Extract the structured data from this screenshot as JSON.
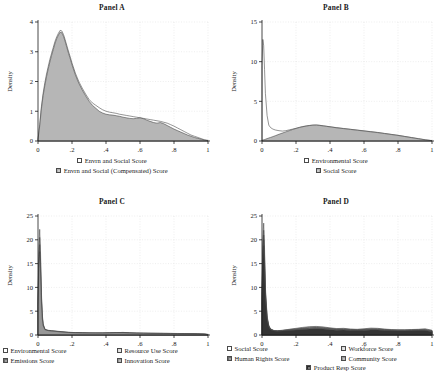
{
  "figure": {
    "background": "#ffffff",
    "axis_color": "#1a1a1a",
    "grid_color": "#d8d8d8"
  },
  "palette": {
    "white": "#ffffff",
    "light_gray": "#d9d9d9",
    "mid_gray": "#b0b0b0",
    "gray": "#9a9a9a",
    "dark_gray": "#6e6e6e",
    "darker_gray": "#4f4f4f",
    "near_black": "#2b2b2b",
    "outline": "#3c3c3c"
  },
  "panels": [
    {
      "id": "panel-a",
      "title": "Panel A",
      "ylabel": "Density",
      "xlim": [
        0,
        1
      ],
      "ylim": [
        0,
        4
      ],
      "yticks": [
        0,
        1,
        2,
        3,
        4
      ],
      "ytick_labels": [
        "0",
        "1",
        "2",
        "3",
        "4"
      ],
      "xticks": [
        0,
        0.2,
        0.4,
        0.6,
        0.8,
        1
      ],
      "xtick_labels": [
        "0",
        ".2",
        ".4",
        ".6",
        ".8",
        "1"
      ],
      "legend_rows": [
        [
          {
            "label": "Envrn and Social Score",
            "color": "#ffffff"
          }
        ],
        [
          {
            "label": "Envrn and Social (Compensated) Score",
            "color": "#b0b0b0"
          }
        ]
      ]
    },
    {
      "id": "panel-b",
      "title": "Panel B",
      "ylabel": "Density",
      "xlim": [
        0,
        1
      ],
      "ylim": [
        0,
        15
      ],
      "yticks": [
        0,
        5,
        10,
        15
      ],
      "ytick_labels": [
        "0",
        "5",
        "10",
        "15"
      ],
      "xticks": [
        0,
        0.2,
        0.4,
        0.6,
        0.8,
        1
      ],
      "xtick_labels": [
        "0",
        ".2",
        ".4",
        ".6",
        ".8",
        "1"
      ],
      "legend_rows": [
        [
          {
            "label": "Environmental Score",
            "color": "#ffffff"
          }
        ],
        [
          {
            "label": "Social Score",
            "color": "#b0b0b0"
          }
        ]
      ]
    },
    {
      "id": "panel-c",
      "title": "Panel C",
      "ylabel": "Density",
      "xlim": [
        0,
        1
      ],
      "ylim": [
        0,
        25
      ],
      "yticks": [
        0,
        5,
        10,
        15,
        20,
        25
      ],
      "ytick_labels": [
        "0",
        "5",
        "10",
        "15",
        "20",
        "25"
      ],
      "xticks": [
        0,
        0.2,
        0.4,
        0.6,
        0.8,
        1
      ],
      "xtick_labels": [
        "0",
        ".2",
        ".4",
        ".6",
        ".8",
        "1"
      ],
      "legend_rows": [
        [
          {
            "label": "Environmental Score",
            "color": "#ffffff"
          },
          {
            "label": "Resource Use Score",
            "color": "#d9d9d9"
          }
        ],
        [
          {
            "label": "Emissions Score",
            "color": "#6e6e6e"
          },
          {
            "label": "Innovation Score",
            "color": "#9a9a9a"
          }
        ]
      ]
    },
    {
      "id": "panel-d",
      "title": "Panel D",
      "ylabel": "Density",
      "xlim": [
        0,
        1
      ],
      "ylim": [
        0,
        25
      ],
      "yticks": [
        0,
        5,
        10,
        15,
        20,
        25
      ],
      "ytick_labels": [
        "0",
        "5",
        "10",
        "15",
        "20",
        "25"
      ],
      "xticks": [
        0,
        0.2,
        0.4,
        0.6,
        0.8,
        1
      ],
      "xtick_labels": [
        "0",
        ".2",
        ".4",
        ".6",
        ".8",
        "1"
      ],
      "legend_rows": [
        [
          {
            "label": "Social Score",
            "color": "#ffffff"
          },
          {
            "label": "Workforce Score",
            "color": "#d9d9d9"
          }
        ],
        [
          {
            "label": "Human Rights Score",
            "color": "#6e6e6e"
          },
          {
            "label": "Community Score",
            "color": "#9a9a9a"
          }
        ],
        [
          {
            "label": "Product Resp Score",
            "color": "#2b2b2b"
          }
        ]
      ]
    }
  ],
  "chart_data": [
    {
      "type": "area",
      "panel": "panel-a",
      "title": "Panel A",
      "xlabel": "",
      "ylabel": "Density",
      "xlim": [
        0,
        1
      ],
      "ylim": [
        0,
        4
      ],
      "grid": true,
      "legend_position": "below",
      "x": [
        0,
        0.01,
        0.02,
        0.03,
        0.04,
        0.05,
        0.06,
        0.07,
        0.08,
        0.09,
        0.1,
        0.11,
        0.12,
        0.13,
        0.14,
        0.15,
        0.16,
        0.17,
        0.18,
        0.19,
        0.2,
        0.22,
        0.24,
        0.26,
        0.28,
        0.3,
        0.32,
        0.34,
        0.36,
        0.38,
        0.4,
        0.42,
        0.44,
        0.46,
        0.48,
        0.5,
        0.52,
        0.54,
        0.56,
        0.58,
        0.6,
        0.62,
        0.64,
        0.66,
        0.68,
        0.7,
        0.72,
        0.74,
        0.76,
        0.78,
        0.8,
        0.82,
        0.84,
        0.86,
        0.88,
        0.9,
        0.92,
        0.94,
        0.96,
        0.98,
        1.0
      ],
      "series": [
        {
          "name": "Envrn and Social Score",
          "color": "#ffffff",
          "values": [
            0.05,
            0.55,
            1.15,
            1.6,
            1.95,
            2.25,
            2.5,
            2.75,
            2.95,
            3.15,
            3.35,
            3.5,
            3.62,
            3.72,
            3.7,
            3.58,
            3.4,
            3.2,
            3.0,
            2.82,
            2.62,
            2.28,
            2.0,
            1.78,
            1.58,
            1.4,
            1.28,
            1.2,
            1.12,
            1.05,
            1.0,
            0.97,
            0.95,
            0.93,
            0.9,
            0.88,
            0.86,
            0.84,
            0.82,
            0.8,
            0.78,
            0.76,
            0.74,
            0.72,
            0.7,
            0.68,
            0.66,
            0.63,
            0.6,
            0.55,
            0.5,
            0.44,
            0.38,
            0.32,
            0.26,
            0.2,
            0.16,
            0.12,
            0.08,
            0.04,
            0.02
          ]
        },
        {
          "name": "Envrn and Social (Compensated) Score",
          "color": "#b0b0b0",
          "values": [
            0.05,
            0.5,
            1.08,
            1.52,
            1.86,
            2.16,
            2.42,
            2.66,
            2.88,
            3.08,
            3.28,
            3.44,
            3.56,
            3.66,
            3.64,
            3.52,
            3.34,
            3.14,
            2.94,
            2.76,
            2.56,
            2.22,
            1.94,
            1.72,
            1.52,
            1.34,
            1.2,
            1.1,
            1.0,
            0.94,
            0.9,
            0.88,
            0.87,
            0.85,
            0.83,
            0.8,
            0.78,
            0.76,
            0.75,
            0.76,
            0.78,
            0.75,
            0.7,
            0.66,
            0.62,
            0.6,
            0.62,
            0.58,
            0.52,
            0.46,
            0.4,
            0.35,
            0.3,
            0.25,
            0.2,
            0.16,
            0.12,
            0.09,
            0.06,
            0.03,
            0.01
          ]
        }
      ]
    },
    {
      "type": "area",
      "panel": "panel-b",
      "title": "Panel B",
      "xlabel": "",
      "ylabel": "Density",
      "xlim": [
        0,
        1
      ],
      "ylim": [
        0,
        15
      ],
      "grid": true,
      "legend_position": "below",
      "x": [
        0,
        0.005,
        0.01,
        0.015,
        0.02,
        0.03,
        0.04,
        0.05,
        0.06,
        0.07,
        0.08,
        0.1,
        0.12,
        0.14,
        0.16,
        0.18,
        0.2,
        0.22,
        0.24,
        0.26,
        0.28,
        0.3,
        0.32,
        0.34,
        0.36,
        0.38,
        0.4,
        0.44,
        0.48,
        0.52,
        0.56,
        0.6,
        0.64,
        0.68,
        0.72,
        0.76,
        0.8,
        0.84,
        0.88,
        0.92,
        0.96,
        1.0
      ],
      "series": [
        {
          "name": "Environmental Score",
          "color": "#ffffff",
          "values": [
            9.5,
            12.8,
            12.0,
            9.0,
            6.0,
            3.2,
            2.0,
            1.7,
            1.55,
            1.45,
            1.38,
            1.3,
            1.25,
            1.3,
            1.4,
            1.5,
            1.6,
            1.72,
            1.82,
            1.9,
            1.96,
            2.0,
            2.02,
            1.98,
            1.92,
            1.86,
            1.8,
            1.68,
            1.58,
            1.48,
            1.38,
            1.28,
            1.18,
            1.08,
            0.96,
            0.84,
            0.72,
            0.58,
            0.44,
            0.3,
            0.16,
            0.05
          ]
        },
        {
          "name": "Social Score",
          "color": "#b0b0b0",
          "values": [
            0.1,
            0.12,
            0.15,
            0.18,
            0.22,
            0.3,
            0.38,
            0.45,
            0.52,
            0.6,
            0.68,
            0.85,
            1.0,
            1.15,
            1.3,
            1.45,
            1.58,
            1.7,
            1.8,
            1.88,
            1.95,
            2.0,
            2.0,
            1.96,
            1.9,
            1.84,
            1.78,
            1.66,
            1.56,
            1.46,
            1.36,
            1.26,
            1.16,
            1.06,
            0.94,
            0.82,
            0.7,
            0.56,
            0.42,
            0.28,
            0.14,
            0.04
          ]
        }
      ]
    },
    {
      "type": "area",
      "panel": "panel-c",
      "title": "Panel C",
      "xlabel": "",
      "ylabel": "Density",
      "xlim": [
        0,
        1
      ],
      "ylim": [
        0,
        25
      ],
      "grid": true,
      "legend_position": "below",
      "x": [
        0,
        0.005,
        0.01,
        0.015,
        0.02,
        0.025,
        0.03,
        0.04,
        0.05,
        0.06,
        0.08,
        0.1,
        0.14,
        0.18,
        0.22,
        0.26,
        0.3,
        0.34,
        0.38,
        0.42,
        0.46,
        0.5,
        0.54,
        0.58,
        0.62,
        0.66,
        0.7,
        0.74,
        0.78,
        0.82,
        0.86,
        0.9,
        0.94,
        0.98,
        1.0
      ],
      "series": [
        {
          "name": "Environmental Score",
          "color": "#ffffff",
          "values": [
            8.0,
            18.0,
            22.2,
            17.0,
            9.0,
            4.5,
            2.4,
            1.3,
            1.0,
            0.9,
            0.8,
            0.75,
            0.6,
            0.5,
            0.45,
            0.42,
            0.4,
            0.4,
            0.4,
            0.42,
            0.48,
            0.55,
            0.45,
            0.4,
            0.38,
            0.36,
            0.35,
            0.34,
            0.33,
            0.32,
            0.3,
            0.28,
            0.25,
            0.2,
            0.12
          ]
        },
        {
          "name": "Resource Use Score",
          "color": "#d9d9d9",
          "values": [
            7.0,
            16.5,
            20.5,
            15.5,
            8.2,
            4.1,
            2.2,
            1.25,
            1.05,
            0.95,
            0.85,
            0.8,
            0.65,
            0.55,
            0.48,
            0.45,
            0.43,
            0.42,
            0.42,
            0.44,
            0.5,
            0.52,
            0.44,
            0.4,
            0.38,
            0.36,
            0.35,
            0.34,
            0.33,
            0.31,
            0.29,
            0.27,
            0.24,
            0.19,
            0.1
          ]
        },
        {
          "name": "Emissions Score",
          "color": "#6e6e6e",
          "values": [
            6.5,
            15.0,
            19.0,
            14.0,
            7.5,
            3.8,
            2.1,
            1.2,
            1.1,
            1.0,
            0.9,
            0.85,
            0.7,
            0.58,
            0.5,
            0.46,
            0.44,
            0.43,
            0.43,
            0.45,
            0.5,
            0.5,
            0.43,
            0.39,
            0.37,
            0.35,
            0.34,
            0.33,
            0.32,
            0.3,
            0.28,
            0.26,
            0.23,
            0.18,
            0.09
          ]
        },
        {
          "name": "Innovation Score",
          "color": "#9a9a9a",
          "values": [
            6.0,
            14.0,
            17.5,
            13.0,
            7.0,
            3.5,
            2.0,
            1.15,
            1.0,
            0.92,
            0.82,
            0.78,
            0.62,
            0.52,
            0.46,
            0.43,
            0.41,
            0.4,
            0.4,
            0.42,
            0.46,
            0.46,
            0.4,
            0.37,
            0.35,
            0.34,
            0.33,
            0.32,
            0.31,
            0.29,
            0.27,
            0.25,
            0.22,
            0.17,
            0.08
          ]
        }
      ]
    },
    {
      "type": "area",
      "panel": "panel-d",
      "title": "Panel D",
      "xlabel": "",
      "ylabel": "Density",
      "xlim": [
        0,
        1
      ],
      "ylim": [
        0,
        25
      ],
      "grid": true,
      "legend_position": "below",
      "x": [
        0,
        0.005,
        0.01,
        0.015,
        0.02,
        0.03,
        0.04,
        0.05,
        0.07,
        0.09,
        0.12,
        0.16,
        0.2,
        0.24,
        0.28,
        0.32,
        0.36,
        0.4,
        0.44,
        0.48,
        0.52,
        0.56,
        0.6,
        0.64,
        0.68,
        0.72,
        0.76,
        0.8,
        0.84,
        0.88,
        0.92,
        0.96,
        1.0
      ],
      "series": [
        {
          "name": "Social Score",
          "color": "#ffffff",
          "values": [
            9.0,
            20.0,
            23.5,
            18.0,
            10.0,
            4.0,
            2.0,
            1.3,
            0.95,
            0.9,
            1.0,
            1.2,
            1.4,
            1.6,
            1.75,
            1.8,
            1.7,
            1.5,
            1.35,
            1.4,
            1.25,
            1.2,
            1.3,
            1.45,
            1.4,
            1.25,
            1.15,
            1.1,
            1.1,
            1.15,
            1.2,
            1.3,
            1.0
          ]
        },
        {
          "name": "Workforce Score",
          "color": "#d9d9d9",
          "values": [
            8.0,
            18.5,
            22.0,
            16.5,
            9.2,
            3.7,
            1.9,
            1.25,
            0.92,
            0.88,
            0.96,
            1.15,
            1.32,
            1.5,
            1.65,
            1.7,
            1.6,
            1.42,
            1.28,
            1.32,
            1.18,
            1.14,
            1.22,
            1.35,
            1.32,
            1.18,
            1.1,
            1.05,
            1.05,
            1.1,
            1.15,
            1.2,
            0.92
          ]
        },
        {
          "name": "Human Rights Score",
          "color": "#6e6e6e",
          "values": [
            7.5,
            17.5,
            21.0,
            15.5,
            8.8,
            3.5,
            1.85,
            1.2,
            0.9,
            0.85,
            0.92,
            1.08,
            1.24,
            1.4,
            1.52,
            1.58,
            1.5,
            1.34,
            1.2,
            1.24,
            1.12,
            1.08,
            1.15,
            1.26,
            1.24,
            1.12,
            1.04,
            1.0,
            1.0,
            1.04,
            1.08,
            1.12,
            0.85
          ]
        },
        {
          "name": "Community Score",
          "color": "#9a9a9a",
          "values": [
            7.0,
            16.5,
            20.0,
            14.5,
            8.2,
            3.3,
            1.8,
            1.15,
            0.88,
            0.82,
            0.88,
            1.0,
            1.14,
            1.28,
            1.4,
            1.44,
            1.38,
            1.24,
            1.12,
            1.16,
            1.05,
            1.0,
            1.06,
            1.16,
            1.14,
            1.04,
            0.97,
            0.94,
            0.94,
            0.97,
            1.0,
            1.04,
            0.78
          ]
        },
        {
          "name": "Product Resp Score",
          "color": "#2b2b2b",
          "values": [
            6.5,
            15.5,
            18.8,
            13.5,
            7.6,
            3.1,
            1.7,
            1.1,
            0.85,
            0.78,
            0.82,
            0.92,
            1.04,
            1.16,
            1.26,
            1.3,
            1.25,
            1.12,
            1.02,
            1.05,
            0.96,
            0.92,
            0.96,
            1.05,
            1.04,
            0.95,
            0.89,
            0.86,
            0.86,
            0.89,
            0.92,
            0.95,
            0.7
          ]
        }
      ]
    }
  ]
}
